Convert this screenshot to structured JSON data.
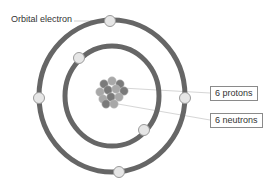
{
  "diagram": {
    "labels": {
      "orbital_electron": "Orbital electron",
      "protons": "6 protons",
      "neutrons": "6 neutrons"
    },
    "shells": [
      {
        "name": "inner-shell",
        "electron_count": 2
      },
      {
        "name": "outer-shell",
        "electron_count": 4
      }
    ],
    "nucleus": {
      "protons": 6,
      "neutrons": 6
    },
    "colors": {
      "orbit": "#666666",
      "electron_fill": "#e6e6e6",
      "electron_stroke": "#9a9a9a",
      "proton": "#7a7a7a",
      "neutron": "#a8a8a8",
      "leader_line": "#cfcfcf",
      "text": "#333333"
    }
  }
}
